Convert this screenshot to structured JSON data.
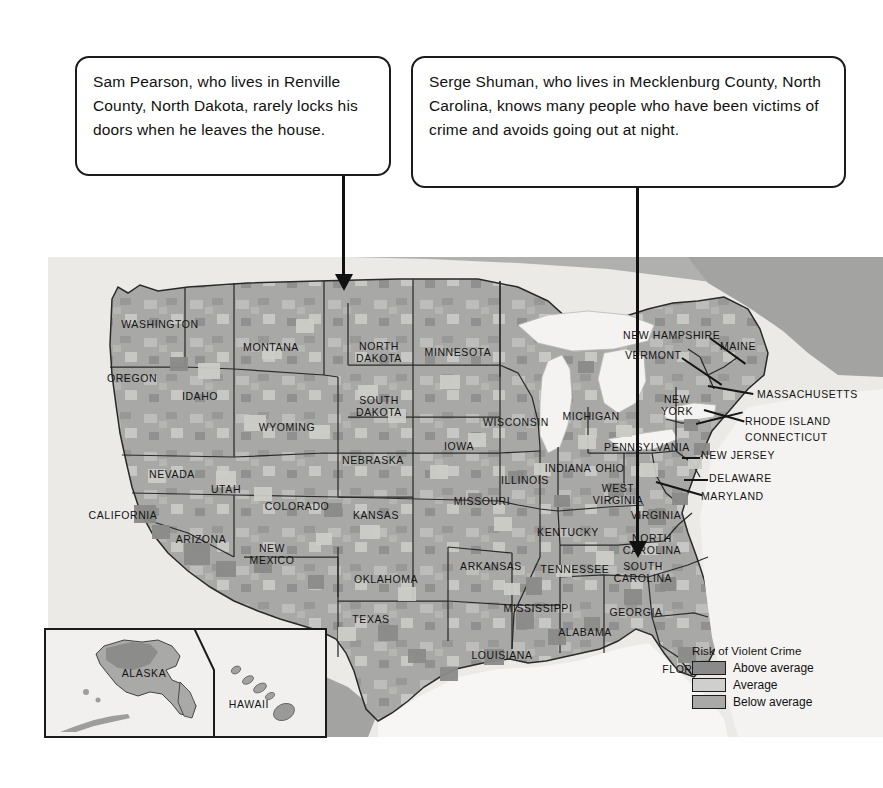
{
  "callouts": [
    {
      "id": "sam",
      "text": "Sam Pearson, who lives in Renville County, North Dakota, rarely locks his doors when he leaves the house."
    },
    {
      "id": "serge",
      "text": "Serge Shuman, who lives in Mecklenburg County, North Carolina, knows many people who have been victims of crime and avoids going out at night."
    }
  ],
  "legend": {
    "title": "Risk of Violent Crime",
    "items": [
      {
        "label": "Above average",
        "color": "#8a8a8a"
      },
      {
        "label": "Average",
        "color": "#cfcfcd"
      },
      {
        "label": "Below average",
        "color": "#a9a9a7"
      }
    ]
  },
  "map": {
    "background_color": "#ebeae7",
    "land_color": "#a8a8a6",
    "water_color": "#f4f3f1",
    "border_color": "#2a2a2a",
    "states": [
      {
        "name": "WASHINGTON",
        "x": 112,
        "y": 67,
        "lines": [
          "WASHINGTON"
        ]
      },
      {
        "name": "OREGON",
        "x": 84,
        "y": 121,
        "lines": [
          "OREGON"
        ]
      },
      {
        "name": "IDAHO",
        "x": 152,
        "y": 139,
        "lines": [
          "IDAHO"
        ]
      },
      {
        "name": "MONTANA",
        "x": 223,
        "y": 90,
        "lines": [
          "MONTANA"
        ]
      },
      {
        "name": "WYOMING",
        "x": 239,
        "y": 170,
        "lines": [
          "WYOMING"
        ]
      },
      {
        "name": "NEVADA",
        "x": 124,
        "y": 217,
        "lines": [
          "NEVADA"
        ]
      },
      {
        "name": "UTAH",
        "x": 178,
        "y": 232,
        "lines": [
          "UTAH"
        ]
      },
      {
        "name": "CALIFORNIA",
        "x": 75,
        "y": 258,
        "lines": [
          "CALIFORNIA"
        ]
      },
      {
        "name": "COLORADO",
        "x": 249,
        "y": 249,
        "lines": [
          "COLORADO"
        ]
      },
      {
        "name": "ARIZONA",
        "x": 153,
        "y": 282,
        "lines": [
          "ARIZONA"
        ]
      },
      {
        "name": "NEW MEXICO",
        "x": 224,
        "y": 297,
        "lines": [
          "NEW",
          "MEXICO"
        ]
      },
      {
        "name": "NORTH DAKOTA",
        "x": 331,
        "y": 95,
        "lines": [
          "NORTH",
          "DAKOTA"
        ]
      },
      {
        "name": "SOUTH DAKOTA",
        "x": 331,
        "y": 149,
        "lines": [
          "SOUTH",
          "DAKOTA"
        ]
      },
      {
        "name": "NEBRASKA",
        "x": 325,
        "y": 203,
        "lines": [
          "NEBRASKA"
        ]
      },
      {
        "name": "KANSAS",
        "x": 328,
        "y": 258,
        "lines": [
          "KANSAS"
        ]
      },
      {
        "name": "OKLAHOMA",
        "x": 338,
        "y": 322,
        "lines": [
          "OKLAHOMA"
        ]
      },
      {
        "name": "TEXAS",
        "x": 323,
        "y": 362,
        "lines": [
          "TEXAS"
        ]
      },
      {
        "name": "MINNESOTA",
        "x": 410,
        "y": 95,
        "lines": [
          "MINNESOTA"
        ]
      },
      {
        "name": "IOWA",
        "x": 411,
        "y": 189,
        "lines": [
          "IOWA"
        ]
      },
      {
        "name": "MISSOURI",
        "x": 434,
        "y": 244,
        "lines": [
          "MISSOURI"
        ]
      },
      {
        "name": "ARKANSAS",
        "x": 443,
        "y": 309,
        "lines": [
          "ARKANSAS"
        ]
      },
      {
        "name": "LOUISIANA",
        "x": 454,
        "y": 398,
        "lines": [
          "LOUISIANA"
        ]
      },
      {
        "name": "WISCONSIN",
        "x": 468,
        "y": 165,
        "lines": [
          "WISCONSIN"
        ]
      },
      {
        "name": "ILLINOIS",
        "x": 477,
        "y": 223,
        "lines": [
          "ILLINOIS"
        ]
      },
      {
        "name": "MICHIGAN",
        "x": 543,
        "y": 159,
        "lines": [
          "MICHIGAN"
        ]
      },
      {
        "name": "INDIANA",
        "x": 520,
        "y": 211,
        "lines": [
          "INDIANA"
        ]
      },
      {
        "name": "OHIO",
        "x": 562,
        "y": 211,
        "lines": [
          "OHIO"
        ]
      },
      {
        "name": "KENTUCKY",
        "x": 520,
        "y": 275,
        "lines": [
          "KENTUCKY"
        ]
      },
      {
        "name": "TENNESSEE",
        "x": 527,
        "y": 312,
        "lines": [
          "TENNESSEE"
        ]
      },
      {
        "name": "MISSISSIPPI",
        "x": 490,
        "y": 351,
        "lines": [
          "MISSISSIPPI"
        ]
      },
      {
        "name": "ALABAMA",
        "x": 537,
        "y": 375,
        "lines": [
          "ALABAMA"
        ]
      },
      {
        "name": "GEORGIA",
        "x": 588,
        "y": 355,
        "lines": [
          "GEORGIA"
        ]
      },
      {
        "name": "FLORIDA",
        "x": 639,
        "y": 412,
        "lines": [
          "FLORIDA"
        ]
      },
      {
        "name": "SOUTH CAROLINA",
        "x": 595,
        "y": 315,
        "lines": [
          "SOUTH",
          "CAROLINA"
        ]
      },
      {
        "name": "NORTH CAROLINA",
        "x": 604,
        "y": 287,
        "lines": [
          "NORTH",
          "CAROLINA"
        ]
      },
      {
        "name": "WEST VIRGINIA",
        "x": 570,
        "y": 237,
        "lines": [
          "WEST",
          "VIRGINIA"
        ]
      },
      {
        "name": "VIRGINIA",
        "x": 608,
        "y": 258,
        "lines": [
          "VIRGINIA"
        ]
      },
      {
        "name": "PENNSYLVANIA",
        "x": 599,
        "y": 190,
        "lines": [
          "PENNSYLVANIA"
        ]
      },
      {
        "name": "NEW YORK",
        "x": 629,
        "y": 148,
        "lines": [
          "NEW",
          "YORK"
        ]
      },
      {
        "name": "MAINE",
        "x": 690,
        "y": 89,
        "lines": [
          "MAINE"
        ]
      },
      {
        "name": "NEW HAMPSHIRE",
        "x": 575,
        "y": 78,
        "lines": [
          "NEW HAMPSHIRE"
        ],
        "align": "left"
      },
      {
        "name": "VERMONT",
        "x": 577,
        "y": 98,
        "lines": [
          "VERMONT"
        ],
        "align": "left"
      },
      {
        "name": "MASSACHUSETTS",
        "x": 709,
        "y": 137,
        "lines": [
          "MASSACHUSETTS"
        ],
        "align": "left"
      },
      {
        "name": "RHODE ISLAND",
        "x": 697,
        "y": 164,
        "lines": [
          "RHODE ISLAND"
        ],
        "align": "left"
      },
      {
        "name": "CONNECTICUT",
        "x": 697,
        "y": 180,
        "lines": [
          "CONNECTICUT"
        ],
        "align": "left"
      },
      {
        "name": "NEW JERSEY",
        "x": 653,
        "y": 198,
        "lines": [
          "NEW JERSEY"
        ],
        "align": "left"
      },
      {
        "name": "DELAWARE",
        "x": 661,
        "y": 221,
        "lines": [
          "DELAWARE"
        ],
        "align": "left"
      },
      {
        "name": "MARYLAND",
        "x": 653,
        "y": 239,
        "lines": [
          "MARYLAND"
        ],
        "align": "left"
      }
    ]
  },
  "inset": {
    "alaska_label": "ALASKA",
    "hawaii_label": "HAWAII"
  }
}
